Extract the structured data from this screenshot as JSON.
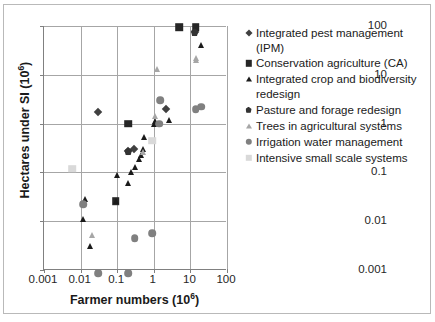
{
  "chart_data": {
    "type": "scatter",
    "title": "",
    "xlabel": "Farmer numbers (10⁶)",
    "ylabel": "Hectares under SI (10⁶)",
    "xscale": "log",
    "yscale": "log",
    "xlim": [
      0.001,
      100
    ],
    "ylim": [
      0.001,
      100
    ],
    "xticks": [
      "0.001",
      "0.01",
      "0.1",
      "1",
      "10",
      "100"
    ],
    "xtick_values": [
      0.001,
      0.01,
      0.1,
      1,
      10,
      100
    ],
    "yticks": [
      "0.001",
      "0.01",
      "0.1",
      "1",
      "10",
      "100"
    ],
    "ytick_values": [
      0.001,
      0.01,
      0.1,
      1,
      10,
      100
    ],
    "grid": true,
    "legend_position": "right",
    "series": [
      {
        "name": "Integrated pest management (IPM)",
        "marker": "diamond",
        "color": "#404040",
        "points": [
          [
            0.03,
            1.7
          ],
          [
            0.2,
            0.27
          ],
          [
            0.28,
            0.3
          ],
          [
            2.2,
            2.0
          ],
          [
            13.0,
            75.0
          ]
        ]
      },
      {
        "name": "Conservation agriculture (CA)",
        "marker": "square",
        "color": "#262626",
        "points": [
          [
            0.09,
            0.026
          ],
          [
            0.2,
            1.0
          ],
          [
            5.0,
            95.0
          ],
          [
            14.0,
            95.0
          ]
        ]
      },
      {
        "name": "Integrated crop and biodiversity redesign",
        "marker": "triangle",
        "color": "#1a1a1a",
        "points": [
          [
            0.013,
            0.028
          ],
          [
            0.012,
            0.011
          ],
          [
            0.018,
            0.0031
          ],
          [
            0.09,
            0.026
          ],
          [
            0.1,
            0.09
          ],
          [
            0.2,
            0.06
          ],
          [
            0.24,
            0.1
          ],
          [
            0.3,
            0.13
          ],
          [
            0.4,
            0.19
          ],
          [
            0.45,
            0.23
          ],
          [
            0.5,
            0.3
          ],
          [
            0.55,
            0.52
          ],
          [
            1.0,
            1.0
          ],
          [
            1.05,
            1.15
          ],
          [
            2.6,
            1.2
          ],
          [
            20.0,
            40.0
          ]
        ]
      },
      {
        "name": "Pasture and forage redesign",
        "marker": "pentagon",
        "color": "#333333",
        "points": [
          [
            0.2,
            0.27
          ],
          [
            13.0,
            75.0
          ]
        ]
      },
      {
        "name": "Trees in agricultural systems",
        "marker": "triangle",
        "color": "#a6a6a6",
        "points": [
          [
            0.02,
            0.0052
          ],
          [
            0.5,
            0.26
          ],
          [
            1.1,
            1.4
          ],
          [
            1.2,
            13.0
          ],
          [
            14.0,
            20.0
          ],
          [
            14.5,
            22.0
          ]
        ]
      },
      {
        "name": "Irrigation water management",
        "marker": "circle",
        "color": "#808080",
        "points": [
          [
            0.012,
            0.022
          ],
          [
            0.03,
            0.00085
          ],
          [
            0.2,
            0.00085
          ],
          [
            0.3,
            0.0045
          ],
          [
            0.9,
            0.0057
          ],
          [
            1.4,
            1.0
          ],
          [
            1.5,
            3.0
          ],
          [
            14.0,
            2.0
          ],
          [
            20.0,
            2.2
          ]
        ]
      },
      {
        "name": "Intensive small scale systems",
        "marker": "square",
        "color": "#d9d9d9",
        "points": [
          [
            0.006,
            0.12
          ],
          [
            0.9,
            0.45
          ]
        ]
      }
    ]
  },
  "axes": {
    "x_title": "Farmer numbers (10",
    "x_title_sup": "6",
    "x_title_tail": ")",
    "y_title": "Hectares under SI (10",
    "y_title_sup": "6",
    "y_title_tail": ")"
  },
  "legend": {
    "items": [
      {
        "label": "Integrated pest management (IPM)",
        "marker": "diamond",
        "color": "#404040"
      },
      {
        "label": "Conservation agriculture (CA)",
        "marker": "square",
        "color": "#262626"
      },
      {
        "label": "Integrated crop and biodiversity redesign",
        "marker": "triangle",
        "color": "#1a1a1a"
      },
      {
        "label": "Pasture and forage redesign",
        "marker": "pentagon",
        "color": "#333333"
      },
      {
        "label": "Trees in agricultural systems",
        "marker": "triangle",
        "color": "#a6a6a6"
      },
      {
        "label": "Irrigation water management",
        "marker": "circle",
        "color": "#808080"
      },
      {
        "label": "Intensive small scale systems",
        "marker": "square",
        "color": "#d9d9d9"
      }
    ]
  }
}
